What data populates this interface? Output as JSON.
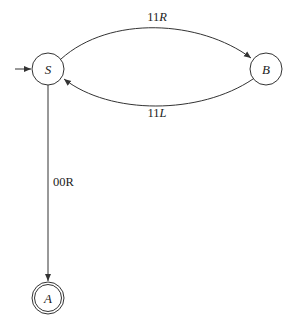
{
  "diagram": {
    "type": "state-machine",
    "states": [
      {
        "id": "S",
        "label": "S",
        "start": true,
        "accepting": false
      },
      {
        "id": "B",
        "label": "B",
        "start": false,
        "accepting": false
      },
      {
        "id": "A",
        "label": "A",
        "start": false,
        "accepting": true
      }
    ],
    "transitions": [
      {
        "from": "S",
        "to": "B",
        "label_digits": "11",
        "label_dir": "R"
      },
      {
        "from": "B",
        "to": "S",
        "label_digits": "11",
        "label_dir": "L"
      },
      {
        "from": "S",
        "to": "A",
        "label": "00R"
      }
    ]
  }
}
